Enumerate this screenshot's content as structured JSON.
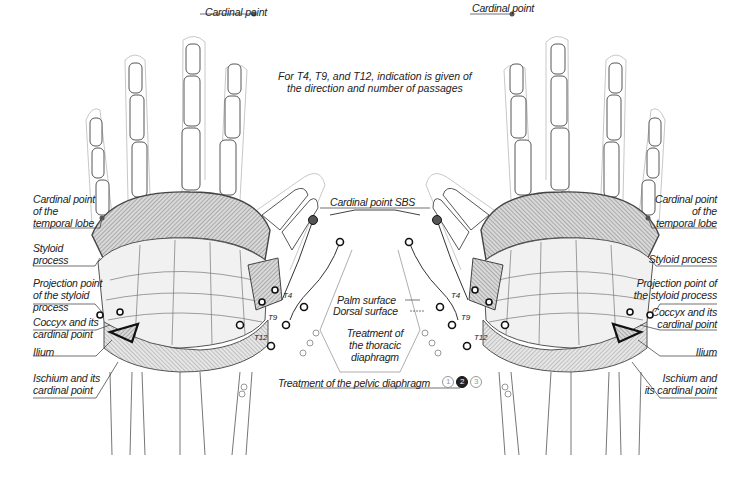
{
  "title_note": {
    "line1": "For T4, T9, and T12, indication is given of",
    "line2": "the direction and number of passages"
  },
  "left_hand": {
    "labels": {
      "cardinal_point": "Cardinal point",
      "temporal_lobe": [
        "Cardinal point",
        "of the",
        "temporal lobe"
      ],
      "styloid": [
        "Styloid",
        "process"
      ],
      "projection": [
        "Projection point",
        "of the styloid",
        "process"
      ],
      "coccyx": [
        "Coccyx and its",
        "cardinal point"
      ],
      "ilium": "Ilium",
      "ischium": [
        "Ischium and its",
        "cardinal point"
      ]
    }
  },
  "right_hand": {
    "labels": {
      "cardinal_point": "Cardinal point",
      "temporal_lobe": [
        "Cardinal point",
        "of the",
        "temporal lobe"
      ],
      "styloid": "Styloid process",
      "projection": [
        "Projection point of",
        "the styloid process"
      ],
      "coccyx": [
        "Coccyx and its",
        "cardinal point"
      ],
      "ilium": "Ilium",
      "ischium": [
        "Ischium and",
        "its cardinal point"
      ]
    }
  },
  "center": {
    "sbs": "Cardinal point SBS",
    "palm_surface": "Palm surface",
    "dorsal_surface": "Dorsal surface",
    "thoracic": [
      "Treatment of",
      "the thoracic",
      "diaphragm"
    ],
    "pelvic": "Treatment of the pelvic diaphragm",
    "pelvic_steps": [
      "1",
      "2",
      "3"
    ],
    "vertebrae": [
      "T4",
      "T9",
      "T12"
    ]
  },
  "colors": {
    "ink": "#222222",
    "bone": "#555555",
    "hatch": "#8a8a8a",
    "outline": "#bbbbbb",
    "point_fill": "#555555"
  }
}
